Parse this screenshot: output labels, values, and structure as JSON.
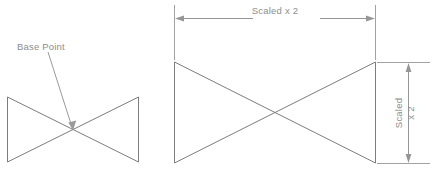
{
  "diagram": {
    "title": "Scale operation with base point",
    "labels": {
      "base_point": "Base Point",
      "horizontal_dimension": "Scaled x 2",
      "vertical_dimension_line1": "Scaled",
      "vertical_dimension_line2": "x 2"
    },
    "colors": {
      "shape_stroke": "#7d7d7d",
      "dimension_stroke": "#969696",
      "extension_stroke": "#a2a2a2",
      "text": "#8d8d8d",
      "background": "#ffffff"
    },
    "original_shape": {
      "name": "bowtie-original",
      "left": 7,
      "right": 139,
      "top": 97,
      "bottom": 162,
      "base_point_x": 73,
      "base_point_y": 130,
      "width": 132,
      "height": 65
    },
    "scaled_shape": {
      "name": "bowtie-scaled",
      "left": 174,
      "right": 376,
      "top": 62,
      "bottom": 163,
      "crossing_x": 275,
      "crossing_y": 112,
      "width": 202,
      "height": 101
    },
    "scale_factor": 2
  }
}
